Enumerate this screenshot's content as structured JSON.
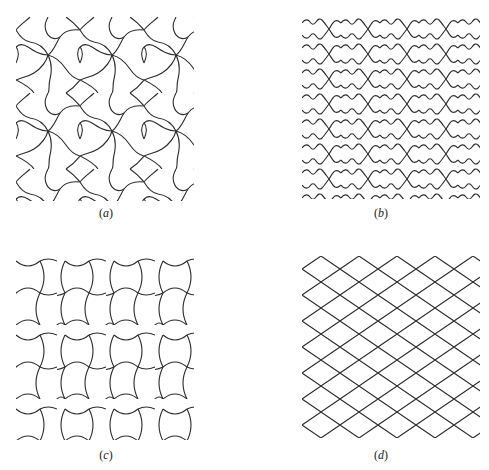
{
  "figure": {
    "panels": [
      {
        "id": "a",
        "label": "(a)",
        "caption_letter": "a",
        "pattern": "pinwheel-curved-triangles"
      },
      {
        "id": "b",
        "label": "(b)",
        "caption_letter": "b",
        "pattern": "wavy-lattice"
      },
      {
        "id": "c",
        "label": "(c)",
        "caption_letter": "c",
        "pattern": "curved-square-bowtie"
      },
      {
        "id": "d",
        "label": "(d)",
        "caption_letter": "d",
        "pattern": "rhombic-lattice"
      }
    ],
    "stroke_color": "#2a2a2a",
    "background_color": "#ffffff"
  }
}
